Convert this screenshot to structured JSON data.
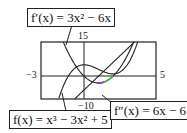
{
  "chart_data": {
    "type": "line",
    "title": "",
    "xlabel": "",
    "ylabel": "",
    "xlim": [
      -3,
      5
    ],
    "ylim": [
      -10,
      15
    ],
    "grid": false,
    "tick_labels": {
      "x_min": "-3",
      "x_max": "5",
      "y_max": "15",
      "y_min": "-10"
    },
    "series": [
      {
        "name": "f(x) = x^3 - 3x^2 + 5",
        "expr": "x^3-3x^2+5",
        "color": "#222222"
      },
      {
        "name": "f'(x) = 3x^2 - 6x",
        "expr": "3x^2-6x",
        "color": "#222222"
      },
      {
        "name": "f''(x) = 6x - 6",
        "expr": "6x-6",
        "color": "#222222"
      }
    ],
    "highlight_colors": [
      "#9b30d0",
      "#4caf50"
    ],
    "annotations": [
      {
        "text": "f'(x) = 3x² − 6x",
        "position": "top-left"
      },
      {
        "text": "f(x) = x³ − 3x² + 5",
        "position": "bottom-left"
      },
      {
        "text": "f''(x) = 6x − 6",
        "position": "bottom-right"
      }
    ]
  },
  "labels": {
    "fprime": "f′(x) = 3x² − 6x",
    "f": "f(x) = x³ − 3x² + 5",
    "fdoubleprime": "f″(x) = 6x − 6"
  },
  "ticks": {
    "x_min": "−3",
    "x_max": "5",
    "y_max": "15",
    "y_min": "−10"
  }
}
